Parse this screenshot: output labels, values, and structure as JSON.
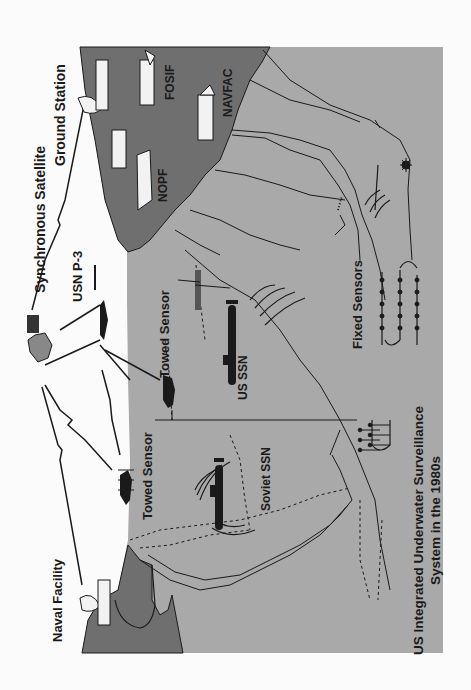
{
  "diagram": {
    "title_line1": "US Integrated Underwater Surveillance",
    "title_line2": "System in the 1980s",
    "orientation": "rotated 90 degrees counter-clockwise",
    "colors": {
      "page_bg": "#fbfbfb",
      "ocean": "#a9a9a9",
      "land": "#6f6f6f",
      "ink": "#1a1a1a",
      "building": "#f2f2f2"
    },
    "labels": {
      "satellite": "Synchronous Satellite",
      "ground_station": "Ground Station",
      "aircraft": "USN P-3",
      "naval_facility": "Naval Facility",
      "towed_sensor_1": "Towed Sensor",
      "towed_sensor_2": "Towed Sensor",
      "nopf": "NOPF",
      "fosif": "FOSIF",
      "navfac": "NAVFAC",
      "us_ssn": "US SSN",
      "soviet_ssn": "Soviet SSN",
      "fixed_sensors": "Fixed Sensors"
    }
  }
}
